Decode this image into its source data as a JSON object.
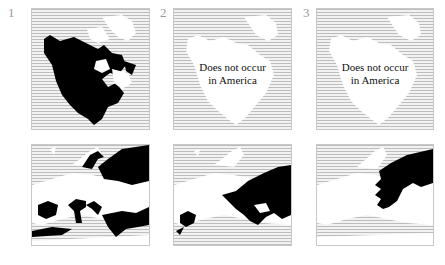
{
  "figure": {
    "columns": [
      {
        "number": "1",
        "america_note": "",
        "america_range": "widespread",
        "europe_range": "southern-and-northeastern"
      },
      {
        "number": "2",
        "america_note": "Does not occur in America",
        "america_note_line1": "Does not occur",
        "america_note_line2": "in America",
        "europe_range": "eastern-and-iberian"
      },
      {
        "number": "3",
        "america_note": "Does not occur in America",
        "america_note_line1": "Does not occur",
        "america_note_line2": "in America",
        "europe_range": "northeastern"
      }
    ],
    "rows": [
      "North America",
      "Europe"
    ]
  },
  "colors": {
    "range": "#000000",
    "land": "#ffffff",
    "sea_hatch": "#bdbdbd",
    "frame": "#c8c8c8",
    "number": "#9a9a9a"
  }
}
